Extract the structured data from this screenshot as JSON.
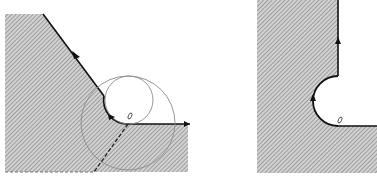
{
  "figure": {
    "panels": [
      {
        "id": "left",
        "description": "Hatched region with a sloped edge, a small tangent circle forming a concave fillet, a larger concentric-offset circle, and a dashed construction line",
        "region_polygon": "5,14 43,14 104,96 A24,24 0 0 0 129,124 L188,124 L188,172 L5,172 Z",
        "hatch_color": "#8a8a8a",
        "edge_color": "#111111",
        "small_circle": {
          "cx": 129,
          "cy": 100,
          "r": 24
        },
        "large_circle": {
          "cx": 128,
          "cy": 123,
          "r": 47
        },
        "circle_color": "#8c8c8c",
        "dashed_line": {
          "x1": 128,
          "y1": 124,
          "x2": 94,
          "y2": 172
        },
        "bottom_dashed_edge": {
          "x1": 5,
          "y1": 172,
          "x2": 94,
          "y2": 172
        },
        "marker": {
          "cx": 130,
          "cy": 116
        },
        "arrows": [
          {
            "x": 76,
            "y": 56,
            "angle": 53
          },
          {
            "x": 112,
            "y": 117,
            "angle": 20
          },
          {
            "x": 188,
            "y": 124,
            "angle": 0
          }
        ]
      },
      {
        "id": "right",
        "description": "Hatched region with a vertical edge and a semicircular notch, boundary traversal arrows",
        "region_polygon": "257,0 338,0 338,76 A25,25 0 0 0 338,126 L377,126 L377,173 L257,173 Z",
        "hatch_color": "#8a8a8a",
        "edge_color": "#111111",
        "notch": {
          "cx": 338,
          "cy": 101,
          "r": 25
        },
        "marker": {
          "cx": 340,
          "cy": 120
        },
        "arrows": [
          {
            "x": 338,
            "y": 40,
            "angle": -90
          },
          {
            "x": 313,
            "y": 98,
            "angle": -90
          }
        ]
      }
    ]
  }
}
